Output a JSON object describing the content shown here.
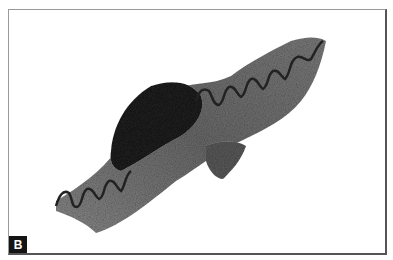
{
  "figure": {
    "panel_label": "B",
    "content": "histology-section-micrograph",
    "colors": {
      "background": "#ffffff",
      "frame": "#555555",
      "label_bg": "#141414",
      "label_text": "#ffffff"
    }
  }
}
